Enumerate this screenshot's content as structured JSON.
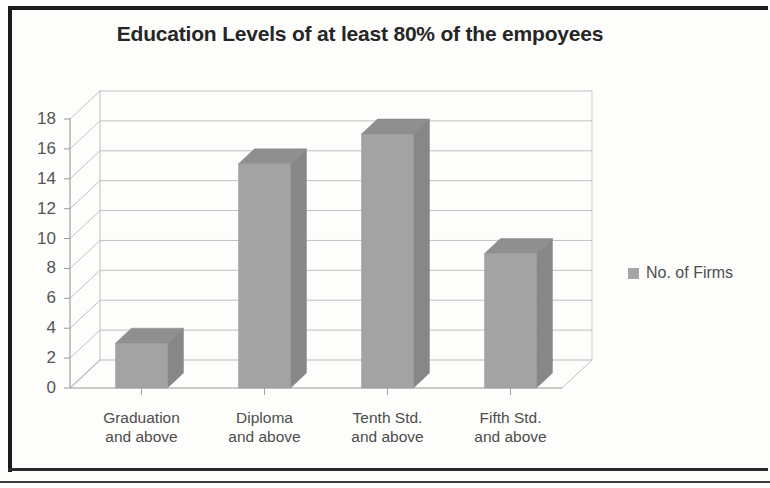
{
  "chart_data": {
    "type": "bar",
    "title": "Education Levels of at least 80% of the empoyees",
    "xlabel": "",
    "ylabel": "",
    "categories": [
      "Graduation and above",
      "Diploma and above",
      "Tenth Std. and above",
      "Fifth Std. and above"
    ],
    "category_lines": [
      [
        "Graduation",
        "and above"
      ],
      [
        "Diploma",
        "and above"
      ],
      [
        "Tenth Std.",
        "and above"
      ],
      [
        "Fifth Std.",
        "and above"
      ]
    ],
    "series": [
      {
        "name": "No. of Firms",
        "values": [
          3,
          15,
          17,
          9
        ]
      }
    ],
    "values": [
      3,
      15,
      17,
      9
    ],
    "ylim": [
      0,
      18
    ],
    "ytick_labels": [
      "18",
      "16",
      "14",
      "12",
      "10",
      "8",
      "6",
      "4",
      "2",
      "0"
    ],
    "ytick_values": [
      18,
      16,
      14,
      12,
      10,
      8,
      6,
      4,
      2,
      0
    ],
    "grid": true,
    "legend_position": "right",
    "style": "3d-column",
    "colors": {
      "bar_front": "#a3a3a3",
      "bar_side": "#878787",
      "bar_top": "#8f8f8f",
      "grid": "#b9b9b9",
      "axis": "#9a9a9a",
      "title_text": "#262626",
      "tick_text": "#555555",
      "legend_text": "#4f4f4f",
      "background": "#fdfdfb",
      "frame": "#1b1b1b"
    }
  },
  "legend": {
    "entries": [
      {
        "label": "No. of Firms",
        "color": "#a6a6a6"
      }
    ]
  }
}
